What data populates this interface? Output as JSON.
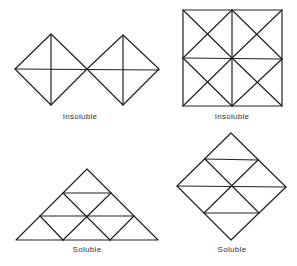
{
  "figures": [
    {
      "id": "two-diamonds",
      "label": "Insoluble",
      "label_x": 80,
      "label_y": 112
    },
    {
      "id": "square-grid",
      "label": "Insoluble",
      "label_x": 232,
      "label_y": 112
    },
    {
      "id": "triangle",
      "label": "Soluble",
      "label_x": 87,
      "label_y": 244
    },
    {
      "id": "diamond",
      "label": "Soluble",
      "label_x": 231,
      "label_y": 244
    }
  ],
  "stroke_color": "#222222"
}
